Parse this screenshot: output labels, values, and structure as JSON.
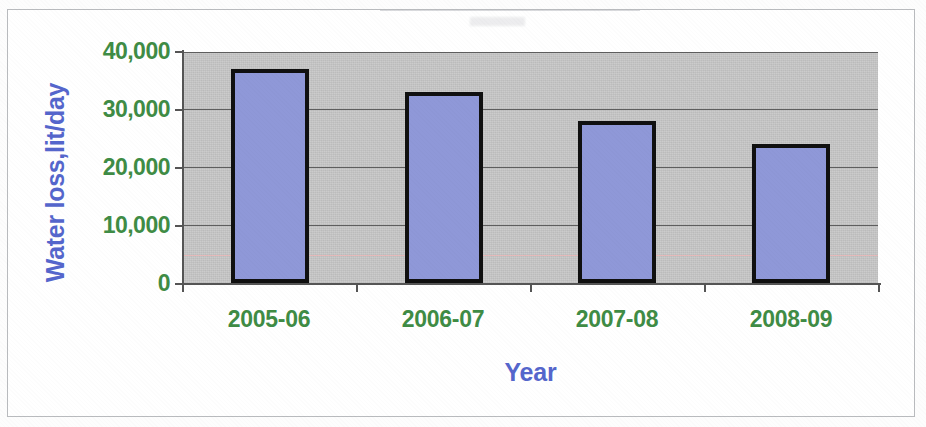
{
  "chart_data": {
    "type": "bar",
    "title": "",
    "categories": [
      "2005-06",
      "2006-07",
      "2007-08",
      "2008-09"
    ],
    "values": [
      37000,
      33000,
      28000,
      24000
    ],
    "xlabel": "Year",
    "ylabel": "Water loss,lit/day",
    "ylim": [
      0,
      40000
    ],
    "ytick_labels": [
      "40,000",
      "30,000",
      "20,000",
      "10,000",
      "0"
    ],
    "ytick_values": [
      40000,
      30000,
      20000,
      10000,
      0
    ],
    "grid": true,
    "legend": false,
    "legend_position": "none",
    "series": [
      {
        "name": "Water loss",
        "values": [
          37000,
          33000,
          28000,
          24000
        ]
      }
    ],
    "annotations": []
  },
  "axes": {
    "y_title": "Water loss,lit/day",
    "x_title": "Year",
    "y_ticks": [
      {
        "label": "40,000",
        "value": 40000
      },
      {
        "label": "30,000",
        "value": 30000
      },
      {
        "label": "20,000",
        "value": 20000
      },
      {
        "label": "10,000",
        "value": 10000
      },
      {
        "label": "0",
        "value": 0
      }
    ],
    "x_ticks": [
      {
        "label": "2005-06"
      },
      {
        "label": "2006-07"
      },
      {
        "label": "2007-08"
      },
      {
        "label": "2008-09"
      }
    ]
  },
  "colors": {
    "bar_fill": "#8f98d8",
    "bar_border": "#101010",
    "plot_background": "#c9c9c9",
    "axis_title": "#5566cc",
    "tick_label": "#3f8c45",
    "gridline": "#5e5e5e",
    "artifact_line": "#f0b6b6",
    "page_background": "#ffffff",
    "frame_border": "#b9bbbe"
  }
}
